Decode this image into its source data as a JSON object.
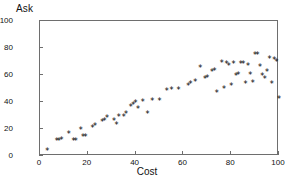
{
  "chart_data": {
    "type": "scatter",
    "title": "",
    "xlabel": "Cost",
    "ylabel": "Ask",
    "xlim": [
      0,
      100
    ],
    "ylim": [
      0,
      100
    ],
    "xticks": [
      0,
      20,
      40,
      60,
      80,
      100
    ],
    "yticks": [
      0,
      20,
      40,
      60,
      80,
      100
    ],
    "grid": false,
    "legend": null,
    "marker": "*",
    "marker_color": "#000000",
    "frame_color": "#6e6e6e",
    "points": [
      [
        3,
        4
      ],
      [
        7,
        11
      ],
      [
        8,
        11
      ],
      [
        9,
        12
      ],
      [
        12,
        16
      ],
      [
        14,
        11
      ],
      [
        15,
        11
      ],
      [
        17,
        19
      ],
      [
        18,
        14
      ],
      [
        19,
        14
      ],
      [
        22,
        21
      ],
      [
        23,
        22
      ],
      [
        26,
        25
      ],
      [
        27,
        26
      ],
      [
        28,
        28
      ],
      [
        31,
        26
      ],
      [
        32,
        23
      ],
      [
        33,
        29
      ],
      [
        35,
        29
      ],
      [
        36,
        31
      ],
      [
        38,
        36
      ],
      [
        39,
        38
      ],
      [
        40,
        39
      ],
      [
        41,
        35
      ],
      [
        43,
        40
      ],
      [
        45,
        31
      ],
      [
        47,
        41
      ],
      [
        50,
        41
      ],
      [
        53,
        48
      ],
      [
        55,
        49
      ],
      [
        58,
        49
      ],
      [
        62,
        52
      ],
      [
        63,
        53
      ],
      [
        65,
        55
      ],
      [
        67,
        65
      ],
      [
        69,
        57
      ],
      [
        70,
        58
      ],
      [
        72,
        62
      ],
      [
        73,
        63
      ],
      [
        74,
        47
      ],
      [
        76,
        69
      ],
      [
        77,
        50
      ],
      [
        78,
        68
      ],
      [
        79,
        67
      ],
      [
        80,
        52
      ],
      [
        81,
        68
      ],
      [
        82,
        59
      ],
      [
        83,
        60
      ],
      [
        84,
        68
      ],
      [
        85,
        68
      ],
      [
        86,
        53
      ],
      [
        87,
        67
      ],
      [
        88,
        60
      ],
      [
        89,
        54
      ],
      [
        90,
        75
      ],
      [
        91,
        75
      ],
      [
        92,
        66
      ],
      [
        93,
        59
      ],
      [
        94,
        57
      ],
      [
        95,
        62
      ],
      [
        96,
        72
      ],
      [
        97,
        53
      ],
      [
        98,
        71
      ],
      [
        99,
        70
      ],
      [
        100,
        42
      ]
    ]
  }
}
